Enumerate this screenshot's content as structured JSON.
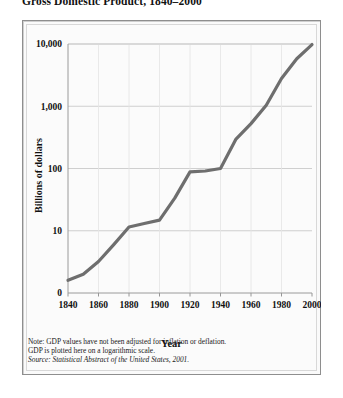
{
  "figure": {
    "title": "Gross Domestic Product, 1840–2000",
    "notes_line1": "Note: GDP values have not been adjusted for inflation or deflation.",
    "notes_line2": "GDP is plotted here on a logarithmic scale.",
    "source": "Source: Statistical Abstract of the United States, 2001."
  },
  "chart_data": {
    "type": "line",
    "title": "Gross Domestic Product, 1840–2000",
    "xlabel": "Year",
    "ylabel": "Billions of dollars",
    "yscale": "log",
    "grid": true,
    "legend": "none",
    "xlim": [
      1840,
      2000
    ],
    "ylim": [
      1,
      10000
    ],
    "xticks": [
      1840,
      1860,
      1880,
      1900,
      1920,
      1940,
      1960,
      1980,
      2000
    ],
    "xticklabels": [
      "1840",
      "1860",
      "1880",
      "1900",
      "1920",
      "1940",
      "1960",
      "1980",
      "2000"
    ],
    "yticks": [
      1,
      10,
      100,
      1000,
      10000
    ],
    "yticklabels": [
      "0",
      "10",
      "100",
      "1,000",
      "10,000"
    ],
    "line_color": "#6e6e6e",
    "line_width": 3.2,
    "series": [
      {
        "name": "Gross Domestic Product",
        "x": [
          1840,
          1850,
          1860,
          1870,
          1880,
          1890,
          1900,
          1910,
          1920,
          1930,
          1940,
          1950,
          1960,
          1970,
          1980,
          1990,
          2000
        ],
        "values": [
          1.6,
          2.0,
          3.2,
          6.0,
          11.5,
          13.1,
          14.8,
          33.4,
          88.4,
          91.2,
          100.0,
          293.0,
          526.0,
          1038.0,
          2790.0,
          5803.0,
          9800.0
        ]
      }
    ]
  }
}
